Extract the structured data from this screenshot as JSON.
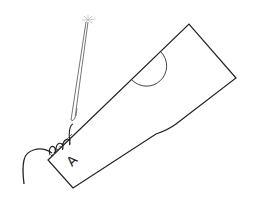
{
  "diagram": {
    "piece_label": "A",
    "colors": {
      "background": "#ffffff",
      "outline": "#222222",
      "needle": "#555555",
      "sparkle": "#bbbbbb"
    },
    "elements": [
      "pattern-piece",
      "semicircle-notch",
      "stitch-line",
      "thread-loops",
      "thread-tail",
      "needle",
      "needle-sparkle",
      "piece-label"
    ]
  }
}
